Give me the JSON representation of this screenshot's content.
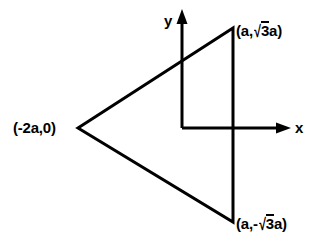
{
  "figure": {
    "type": "diagram",
    "background_color": "#ffffff",
    "stroke_color": "#000000",
    "stroke_width": 3,
    "canvas": {
      "width": 317,
      "height": 246
    }
  },
  "axes": {
    "origin": {
      "x": 182,
      "y": 128
    },
    "x_axis": {
      "label": "x",
      "from": {
        "x": 182,
        "y": 128
      },
      "to": {
        "x": 290,
        "y": 128
      },
      "arrow": "right"
    },
    "y_axis": {
      "label": "y",
      "from": {
        "x": 182,
        "y": 128
      },
      "to": {
        "x": 182,
        "y": 12
      },
      "arrow": "up"
    }
  },
  "shape": {
    "name": "triangle",
    "vertices": [
      {
        "id": "left",
        "x": 78,
        "y": 128,
        "label": "(-2a,0)"
      },
      {
        "id": "top-right",
        "x": 233,
        "y": 28,
        "label_prefix": "(a,",
        "label_radicand": "3",
        "label_suffix": "a)"
      },
      {
        "id": "bottom-right",
        "x": 233,
        "y": 222,
        "label_prefix": "(a,-",
        "label_radicand": "3",
        "label_suffix": "a)"
      }
    ]
  },
  "labels": {
    "left_vertex": "(-2a,0)",
    "top_right": {
      "prefix": "(a,",
      "radical_sign": "√",
      "radicand": "3",
      "suffix": "a)"
    },
    "bottom_right": {
      "prefix": "(a,-",
      "radical_sign": "√",
      "radicand": "3",
      "suffix": "a)"
    },
    "axis_x": "x",
    "axis_y": "y"
  }
}
